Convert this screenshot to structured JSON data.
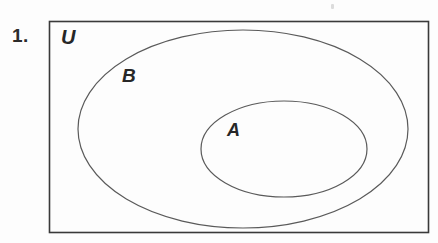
{
  "page": {
    "background_color": "#fdfdfd",
    "width": 438,
    "height": 243
  },
  "problem": {
    "number_label": "1."
  },
  "diagram": {
    "type": "venn-diagram",
    "stroke_color": "#555555",
    "rectangle_stroke_color": "#3a3a3a",
    "fill": "none",
    "universe": {
      "label": "U",
      "shape": "rectangle",
      "x": 49,
      "y": 21,
      "width": 380,
      "height": 212
    },
    "sets": [
      {
        "label": "B",
        "shape": "ellipse",
        "cx": 243,
        "cy": 129,
        "rx": 165,
        "ry": 99
      },
      {
        "label": "A",
        "shape": "ellipse",
        "cx": 284,
        "cy": 149,
        "rx": 83,
        "ry": 48
      }
    ]
  }
}
